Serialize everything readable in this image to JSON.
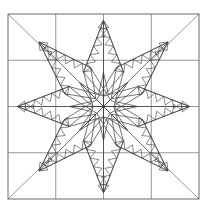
{
  "document": {
    "title": "Feathered Star Quilt Block",
    "kind": "line-art-coloring-page",
    "background_color": "#ffffff",
    "line_color": "#3a3a3a",
    "grid_color": "#6b6b6b"
  },
  "canvas": {
    "width": 211,
    "height": 207
  },
  "block": {
    "x": 8,
    "y": 14,
    "width": 191,
    "height": 185,
    "grid_columns": 4,
    "grid_rows": 4,
    "center_x": 103.5,
    "center_y": 106.5
  },
  "star": {
    "points": 8,
    "inner_star_outer_radius": 34,
    "inner_star_inner_radius": 13,
    "big_point_length": 86,
    "big_point_half_width": 20,
    "diamond_points": 8
  },
  "feathers": {
    "teeth_per_edge": 6,
    "tooth_depth": 7.5
  },
  "corners": {
    "diagonal_count": 4,
    "labels": [
      "top-left-diagonal",
      "top-right-diagonal",
      "bottom-left-diagonal",
      "bottom-right-diagonal"
    ]
  }
}
